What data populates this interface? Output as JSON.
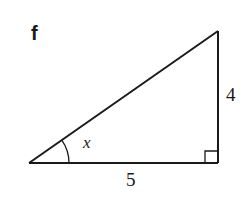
{
  "figure": {
    "part_label": "f",
    "shape": "right-triangle",
    "angle_label": "x",
    "base_length_label": "5",
    "height_length_label": "4",
    "right_angle_marker": true,
    "stroke_color": "#1a1a1a",
    "background_color": "#ffffff"
  }
}
